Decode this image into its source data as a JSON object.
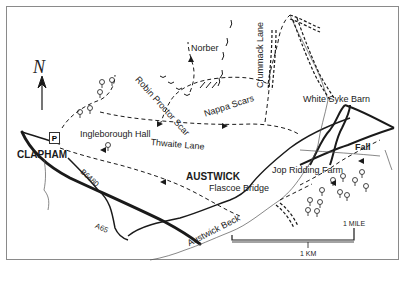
{
  "map": {
    "title": "Austwick and Clapham walk map",
    "north_label": "N",
    "parking_label": "P",
    "towns": {
      "clapham": "CLAPHAM",
      "austwick": "AUSTWICK"
    },
    "places": {
      "ingleborough_hall": "Ingleborough Hall",
      "norber": "Norber",
      "robin_proctor_scar": "Robin Proctor Scar",
      "nappa_scars": "Nappa Scars",
      "crummack_lane": "Crummack Lane",
      "white_syke_barn": "White Syke Barn",
      "thwaite_lane": "Thwaite Lane",
      "fall": "Fall",
      "jop_ridding_farm": "Jop Ridding Farm",
      "flascoe_bridge": "Flascoe Bridge",
      "austwick_beck": "Austwick Beck"
    },
    "roads": {
      "b6480": "B6480",
      "a65": "A65"
    },
    "scale": {
      "mile_label": "1 MILE",
      "km_label": "1 KM"
    },
    "colors": {
      "ink": "#1a1a1a",
      "frame": "#8a8a8a",
      "stream": "#555555",
      "background": "#ffffff"
    }
  }
}
